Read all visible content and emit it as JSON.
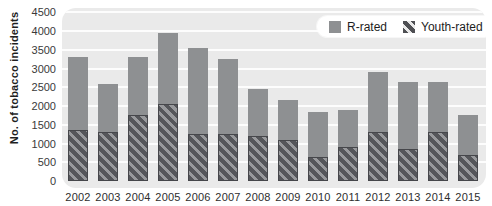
{
  "chart_data": {
    "type": "bar",
    "stacked": true,
    "title": "",
    "xlabel": "",
    "ylabel": "No. of tobacco incidents",
    "categories": [
      "2002",
      "2003",
      "2004",
      "2005",
      "2006",
      "2007",
      "2008",
      "2009",
      "2010",
      "2011",
      "2012",
      "2013",
      "2014",
      "2015"
    ],
    "series": [
      {
        "name": "Youth-rated",
        "stack_position": "bottom",
        "pattern": "diagonal-hatch",
        "values": [
          1350,
          1300,
          1750,
          2050,
          1250,
          1250,
          1200,
          1100,
          650,
          900,
          1300,
          850,
          1300,
          700
        ]
      },
      {
        "name": "R-rated",
        "stack_position": "top",
        "pattern": "solid",
        "values": [
          1950,
          1300,
          1550,
          1900,
          2300,
          2000,
          1250,
          1050,
          1200,
          1000,
          1600,
          1800,
          1350,
          1050
        ]
      }
    ],
    "totals": [
      3300,
      2600,
      3300,
      3950,
      3550,
      3250,
      2450,
      2150,
      1850,
      1900,
      2900,
      2650,
      2650,
      1750
    ],
    "ylim": [
      0,
      4500
    ],
    "ytick_step": 500,
    "yticks": [
      "0",
      "500",
      "1000",
      "1500",
      "2000",
      "2500",
      "3000",
      "3500",
      "4000",
      "4500"
    ],
    "grid": "horizontal-white-lines",
    "legend_position": "top-right"
  },
  "legend": {
    "items": [
      {
        "label": "R-rated",
        "swatch": "solid-gray"
      },
      {
        "label": "Youth-rated",
        "swatch": "hatched"
      }
    ]
  },
  "colors": {
    "r_rated_fill": "#8e9092",
    "youth_hatch_dark": "#55565a",
    "youth_hatch_light": "#98999c",
    "plot_background": "#eaeaea",
    "gridline": "#ffffff",
    "page_background": "#ffffff",
    "text": "#2e2e2e",
    "legend_background": "#ffffff"
  }
}
